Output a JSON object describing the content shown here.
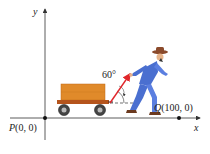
{
  "diagram": {
    "axes": {
      "x_label": "x",
      "y_label": "y"
    },
    "points": {
      "P": {
        "name": "P",
        "coords": "(0, 0)"
      },
      "Q": {
        "name": "Q",
        "coords": "(100, 0)"
      }
    },
    "angle_label": "60°",
    "colors": {
      "axis": "#333333",
      "force_arrow": "#e0262b",
      "cart_body": "#e08a2a",
      "cart_base": "#b5541c",
      "man_clothes": "#4a6fd0",
      "hat": "#8b4a2b"
    }
  }
}
